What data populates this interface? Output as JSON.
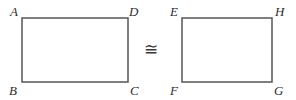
{
  "diagram": {
    "background_color": "#ffffff",
    "stroke_color": "#555555",
    "label_color": "#2e2e2e",
    "stroke_width": 1.5,
    "relation": {
      "symbol": "≅",
      "name": "congruent-to",
      "left_operand": "ABCD",
      "right_operand": "EFGH"
    },
    "shapes": [
      {
        "name": "rectangle-abcd",
        "type": "rectangle",
        "x": 22,
        "y": 18,
        "width": 106,
        "height": 64,
        "vertices": [
          {
            "label": "A",
            "position": "top-left"
          },
          {
            "label": "D",
            "position": "top-right"
          },
          {
            "label": "B",
            "position": "bottom-left"
          },
          {
            "label": "C",
            "position": "bottom-right"
          }
        ]
      },
      {
        "name": "rectangle-efgh",
        "type": "rectangle",
        "x": 182,
        "y": 18,
        "width": 90,
        "height": 64,
        "vertices": [
          {
            "label": "E",
            "position": "top-left"
          },
          {
            "label": "H",
            "position": "top-right"
          },
          {
            "label": "F",
            "position": "bottom-left"
          },
          {
            "label": "G",
            "position": "bottom-right"
          }
        ]
      }
    ]
  }
}
